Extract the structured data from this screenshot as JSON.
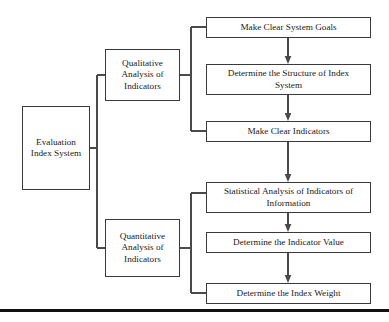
{
  "diagram": {
    "type": "flowchart",
    "orientation": "left-to-right",
    "colors": {
      "background": "#ffffff",
      "box_border": "#3a3a3a",
      "connector": "#4a4a4a",
      "text": "#1a1a1a",
      "bottom_rule": "#111111"
    },
    "nodes": {
      "root": "Evaluation\nIndex System",
      "qualitative": "Qualitative\nAnalysis of\nIndicators",
      "quantitative": "Quantitative\nAnalysis of\nIndicators",
      "goals": "Make Clear System Goals",
      "structure": "Determine the Structure of Index\nSystem",
      "indicators": "Make Clear Indicators",
      "statistical": "Statistical Analysis of Indicators of\nInformation",
      "indicator_value": "Determine the Indicator Value",
      "index_weight": "Determine the Index Weight"
    },
    "edges": [
      {
        "from": "root",
        "to": "qualitative",
        "style": "bracket"
      },
      {
        "from": "root",
        "to": "quantitative",
        "style": "bracket"
      },
      {
        "from": "qualitative",
        "to": "goals",
        "style": "bracket"
      },
      {
        "from": "qualitative",
        "to": "indicators",
        "style": "bracket"
      },
      {
        "from": "goals",
        "to": "structure",
        "style": "arrow-down"
      },
      {
        "from": "structure",
        "to": "indicators",
        "style": "arrow-down"
      },
      {
        "from": "indicators",
        "to": "statistical",
        "style": "arrow-down"
      },
      {
        "from": "quantitative",
        "to": "statistical",
        "style": "bracket"
      },
      {
        "from": "quantitative",
        "to": "index_weight",
        "style": "bracket"
      },
      {
        "from": "statistical",
        "to": "indicator_value",
        "style": "arrow-down"
      },
      {
        "from": "indicator_value",
        "to": "index_weight",
        "style": "arrow-down"
      }
    ]
  }
}
